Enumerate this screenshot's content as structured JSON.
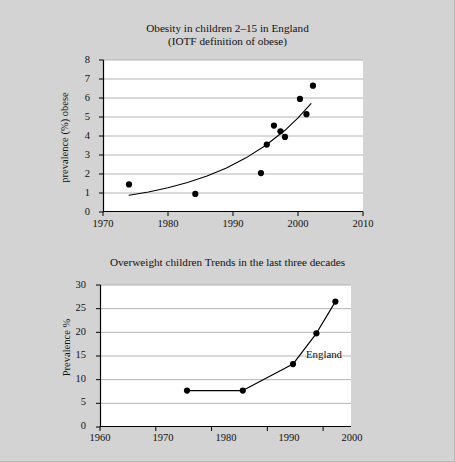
{
  "page": {
    "background_color": "#d3d3d3",
    "plot_background_color": "#ffffff",
    "ink_color": "#000000",
    "gridline_color": "#b4b4b4"
  },
  "chart_data": [
    {
      "type": "scatter",
      "id": "obesity-children-england",
      "title": "Obesity in children 2–15 in England",
      "subtitle": "(IOTF definition of obese)",
      "xlabel": "",
      "ylabel": "prevalence (%) obese",
      "xlim": [
        1970,
        2010
      ],
      "ylim": [
        0,
        8
      ],
      "xticks": [
        1970,
        1980,
        1990,
        2000,
        2010
      ],
      "yticks": [
        0,
        1,
        2,
        3,
        4,
        5,
        6,
        7,
        8
      ],
      "xtick_labels": [
        "1970",
        "1980",
        "1990",
        "2000",
        "2010"
      ],
      "ytick_labels": [
        "0",
        "1",
        "2",
        "3",
        "4",
        "5",
        "6",
        "7",
        "8"
      ],
      "grid": "horizontal",
      "legend": "none",
      "points": [
        {
          "x": 1974.0,
          "y": 1.45
        },
        {
          "x": 1984.2,
          "y": 0.95
        },
        {
          "x": 1994.3,
          "y": 2.05
        },
        {
          "x": 1995.2,
          "y": 3.55
        },
        {
          "x": 1996.3,
          "y": 4.55
        },
        {
          "x": 1997.3,
          "y": 4.25
        },
        {
          "x": 1998.0,
          "y": 3.95
        },
        {
          "x": 2000.3,
          "y": 5.95
        },
        {
          "x": 2001.3,
          "y": 5.15
        },
        {
          "x": 2002.3,
          "y": 6.65
        }
      ],
      "fit_curve": {
        "name": "exponential trend",
        "x_start": 1974.0,
        "x_end": 2002.0,
        "points": [
          {
            "x": 1974.0,
            "y": 0.88
          },
          {
            "x": 1977.0,
            "y": 1.05
          },
          {
            "x": 1980.0,
            "y": 1.28
          },
          {
            "x": 1983.0,
            "y": 1.55
          },
          {
            "x": 1986.0,
            "y": 1.9
          },
          {
            "x": 1989.0,
            "y": 2.32
          },
          {
            "x": 1992.0,
            "y": 2.85
          },
          {
            "x": 1995.0,
            "y": 3.5
          },
          {
            "x": 1998.0,
            "y": 4.3
          },
          {
            "x": 2000.0,
            "y": 4.95
          },
          {
            "x": 2002.0,
            "y": 5.7
          }
        ]
      }
    },
    {
      "type": "line",
      "id": "overweight-children-trends",
      "title": "Overweight children Trends in the last three decades",
      "xlabel": "",
      "ylabel": "Prevalence %",
      "xlim": [
        1960,
        2005
      ],
      "ylim": [
        0,
        30
      ],
      "xticks": [
        1960,
        1970,
        1980,
        1990,
        2000
      ],
      "yticks": [
        0,
        5,
        10,
        15,
        20,
        25,
        30
      ],
      "xtick_labels": [
        "1960",
        "1970",
        "1980",
        "1990",
        "2000"
      ],
      "ytick_labels": [
        "0",
        "5",
        "10",
        "15",
        "20",
        "25",
        "30"
      ],
      "grid": "horizontal",
      "legend": "none",
      "series": [
        {
          "name": "England",
          "annotation": "England",
          "marker": "filled-circle",
          "x": [
            1975.6,
            1985.6,
            1994.6,
            1998.8,
            2002.2
          ],
          "values": [
            7.7,
            7.7,
            13.3,
            19.8,
            26.5
          ]
        }
      ]
    }
  ]
}
